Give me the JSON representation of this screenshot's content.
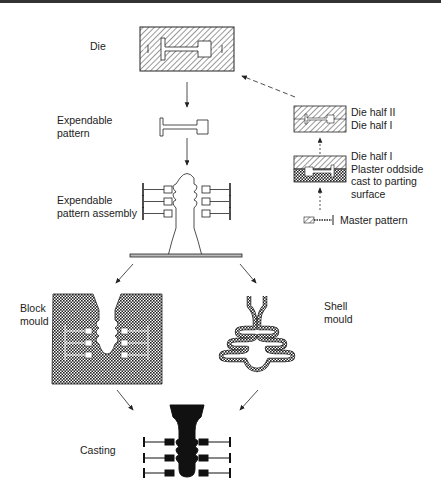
{
  "diagram": {
    "labels": {
      "die": "Die",
      "expendable_pattern": "Expendable\npattern",
      "pattern_assembly": "Expendable\npattern assembly",
      "block_mould": "Block\nmould",
      "shell_mould": "Shell\nmould",
      "casting": "Casting",
      "die_halves": "Die half II\nDie half I",
      "plaster_oddside": "Die half I\nPlaster oddside\ncast to parting\nsurface",
      "master_pattern": "Master pattern"
    },
    "flow": [
      {
        "from": "Master pattern",
        "to": "Plaster oddside",
        "style": "dashed"
      },
      {
        "from": "Plaster oddside",
        "to": "Die halves",
        "style": "dashed"
      },
      {
        "from": "Die halves",
        "to": "Die",
        "style": "dashed"
      },
      {
        "from": "Die",
        "to": "Expendable pattern",
        "style": "solid"
      },
      {
        "from": "Expendable pattern",
        "to": "Expendable pattern assembly",
        "style": "solid"
      },
      {
        "from": "Expendable pattern assembly",
        "to": "Block mould",
        "style": "solid"
      },
      {
        "from": "Expendable pattern assembly",
        "to": "Shell mould",
        "style": "solid"
      },
      {
        "from": "Block mould",
        "to": "Casting",
        "style": "solid"
      },
      {
        "from": "Shell mould",
        "to": "Casting",
        "style": "solid"
      }
    ]
  }
}
